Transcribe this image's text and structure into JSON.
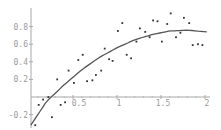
{
  "chart_data": {
    "type": "scatter",
    "title": "",
    "xlabel": "",
    "ylabel": "",
    "xlim": [
      0,
      2.05
    ],
    "ylim": [
      -0.33,
      1.0
    ],
    "grid": false,
    "legend": null,
    "x_ticks": [
      {
        "value": 0.5,
        "label": "0.5"
      },
      {
        "value": 1,
        "label": "1"
      },
      {
        "value": 1.5,
        "label": "1.5"
      },
      {
        "value": 2,
        "label": "2"
      }
    ],
    "y_ticks": [
      {
        "value": -0.2,
        "label": "-0.2"
      },
      {
        "value": 0.2,
        "label": "0.2"
      },
      {
        "value": 0.4,
        "label": "0.4"
      },
      {
        "value": 0.6,
        "label": "0.6"
      },
      {
        "value": 0.8,
        "label": "0.8"
      }
    ],
    "series": [
      {
        "name": "data",
        "kind": "points",
        "x": [
          0.07,
          0.11,
          0.16,
          0.22,
          0.26,
          0.32,
          0.36,
          0.41,
          0.45,
          0.51,
          0.56,
          0.61,
          0.66,
          0.72,
          0.76,
          0.82,
          0.86,
          0.91,
          0.95,
          1.01,
          1.06,
          1.11,
          1.16,
          1.22,
          1.26,
          1.32,
          1.37,
          1.41,
          1.46,
          1.51,
          1.57,
          1.61,
          1.67,
          1.72,
          1.76,
          1.82,
          1.86,
          1.92,
          1.97
        ],
        "y": [
          -0.32,
          -0.09,
          -0.03,
          0.0,
          -0.23,
          0.2,
          -0.09,
          -0.06,
          0.3,
          0.16,
          0.42,
          0.48,
          0.18,
          0.19,
          0.25,
          0.3,
          0.55,
          0.43,
          0.41,
          0.75,
          0.84,
          0.48,
          0.44,
          0.63,
          0.78,
          0.74,
          0.68,
          0.87,
          0.86,
          0.63,
          0.83,
          0.95,
          0.68,
          0.73,
          0.9,
          0.84,
          0.59,
          0.6,
          0.59
        ]
      },
      {
        "name": "fit",
        "kind": "line",
        "x": [
          0.02,
          0.2,
          0.4,
          0.6,
          0.8,
          1.0,
          1.2,
          1.4,
          1.6,
          1.8,
          2.02
        ],
        "y": [
          -0.32,
          -0.05,
          0.14,
          0.31,
          0.45,
          0.56,
          0.65,
          0.71,
          0.75,
          0.76,
          0.74
        ]
      }
    ]
  },
  "colors": {
    "axis": "#a8a8a8",
    "points": "#333333",
    "curve": "#555555",
    "tick_label": "#9a9a9a"
  }
}
